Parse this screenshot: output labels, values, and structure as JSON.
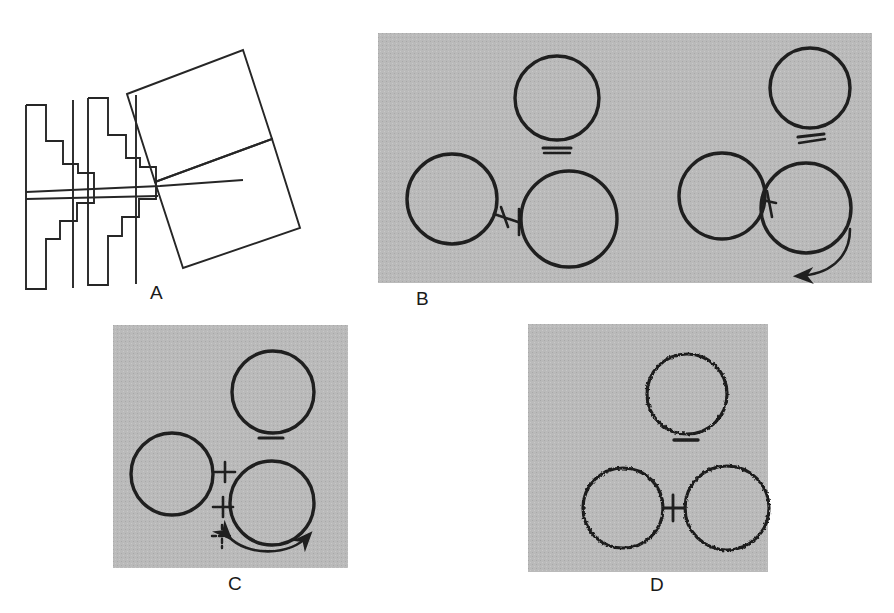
{
  "figure": {
    "background_color": "#ffffff",
    "panel_background_color": "#b9b9b9",
    "ink_color": "#1a1a1a",
    "panels": [
      {
        "id": "A",
        "label": "A",
        "label_x": 150,
        "label_y": 282,
        "type": "line-drawing",
        "has_gray_background": false,
        "description": "Interlocking staircase outlines with rotated quadrilaterals",
        "x": 20,
        "y": 20,
        "width": 330,
        "height": 260
      },
      {
        "id": "B",
        "label": "B",
        "label_x": 416,
        "label_y": 290,
        "type": "micrograph-schematic",
        "has_gray_background": true,
        "x": 378,
        "y": 33,
        "width": 494,
        "height": 250,
        "groups": [
          {
            "name": "left-group",
            "circles": [
              {
                "name": "top-circle",
                "cx": 557,
                "cy": 98,
                "r": 42,
                "outline": "smooth"
              },
              {
                "name": "left-circle",
                "cx": 452,
                "cy": 199,
                "r": 45,
                "outline": "smooth"
              },
              {
                "name": "lower-right-circle",
                "cx": 569,
                "cy": 219,
                "r": 48,
                "outline": "smooth"
              }
            ],
            "bridge": {
              "x1": 494,
              "y1": 216,
              "x2": 521,
              "y2": 223,
              "ticks": 2,
              "tick_styles": [
                "slanted",
                "vertical"
              ]
            },
            "underline_mark": {
              "x": 557,
              "y": 148,
              "width": 28,
              "lines": 2,
              "style": "double-horizontal"
            },
            "arrow": null
          },
          {
            "name": "right-group",
            "circles": [
              {
                "name": "top-circle",
                "cx": 810,
                "cy": 88,
                "r": 40,
                "outline": "smooth"
              },
              {
                "name": "left-circle",
                "cx": 722,
                "cy": 196,
                "r": 43,
                "outline": "smooth"
              },
              {
                "name": "lower-right-circle",
                "cx": 806,
                "cy": 208,
                "r": 45,
                "outline": "smooth"
              }
            ],
            "bridge": {
              "x1": 762,
              "y1": 200,
              "x2": 776,
              "y2": 203,
              "ticks": 1,
              "tick_styles": [
                "slanted"
              ]
            },
            "underline_mark": {
              "x": 812,
              "y": 139,
              "width": 26,
              "lines": 2,
              "style": "double-slanted"
            },
            "arrow": {
              "kind": "curved-single-head",
              "direction": "counter-clockwise",
              "position": "bottom-right"
            }
          }
        ]
      },
      {
        "id": "C",
        "label": "C",
        "label_x": 228,
        "label_y": 588,
        "type": "micrograph-schematic",
        "has_gray_background": true,
        "x": 113,
        "y": 325,
        "width": 235,
        "height": 243,
        "groups": [
          {
            "name": "single-group",
            "circles": [
              {
                "name": "top-circle",
                "cx": 273,
                "cy": 392,
                "r": 41,
                "outline": "smooth"
              },
              {
                "name": "left-circle",
                "cx": 172,
                "cy": 474,
                "r": 41,
                "outline": "smooth"
              },
              {
                "name": "lower-right-circle",
                "cx": 272,
                "cy": 503,
                "r": 42,
                "outline": "smooth"
              }
            ],
            "bridge": null,
            "cross_marks": [
              {
                "name": "cross-upper",
                "cx": 224,
                "cy": 472,
                "size": 9,
                "style": "solid"
              },
              {
                "name": "cross-lower",
                "cx": 222,
                "cy": 507,
                "size": 9,
                "style": "solid"
              },
              {
                "name": "cross-dashed",
                "cx": 221,
                "cy": 536,
                "size": 9,
                "style": "dashed"
              }
            ],
            "underline_mark": {
              "x": 271,
              "y": 438,
              "width": 24,
              "lines": 1,
              "style": "single-horizontal"
            },
            "arrow": {
              "kind": "curved-double-head",
              "direction": "bidirectional",
              "position": "bottom"
            }
          }
        ]
      },
      {
        "id": "D",
        "label": "D",
        "label_x": 650,
        "label_y": 590,
        "type": "micrograph-schematic",
        "has_gray_background": true,
        "x": 528,
        "y": 324,
        "width": 240,
        "height": 248,
        "groups": [
          {
            "name": "single-group",
            "circles": [
              {
                "name": "top-circle",
                "cx": 687,
                "cy": 394,
                "r": 40,
                "outline": "scalloped"
              },
              {
                "name": "bottom-left-circle",
                "cx": 623,
                "cy": 508,
                "r": 40,
                "outline": "scalloped"
              },
              {
                "name": "bottom-right-circle",
                "cx": 727,
                "cy": 508,
                "r": 42,
                "outline": "scalloped"
              }
            ],
            "bridge": {
              "x1": 663,
              "y1": 508,
              "x2": 685,
              "y2": 508,
              "ticks": 1,
              "tick_styles": [
                "vertical"
              ]
            },
            "underline_mark": {
              "x": 686,
              "y": 440,
              "width": 24,
              "lines": 1,
              "style": "single-horizontal"
            },
            "arrow": null
          }
        ]
      }
    ]
  }
}
